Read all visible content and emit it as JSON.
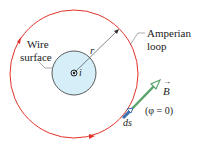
{
  "labels": {
    "wire_line1": "Wire",
    "wire_line2": "surface",
    "amperian_line1": "Amperian",
    "amperian_line2": "loop",
    "radius": "r",
    "current": "i",
    "field": "B",
    "ds": "ds",
    "phi": "(φ = 0)"
  },
  "colors": {
    "loop": "#e0322a",
    "wire_fill": "#d6eef7",
    "field_arrow": "#5aa36a",
    "ds_arrow": "#3b6fb0"
  }
}
